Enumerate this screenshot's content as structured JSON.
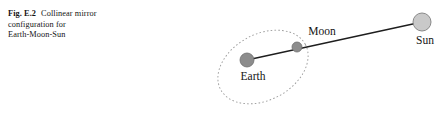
{
  "figure": {
    "caption": {
      "label": "Fig. E.2",
      "line1": "Collinear mirror",
      "line2": "configuration for",
      "line3": "Earth-Moon-Sun",
      "full_text": "Fig. E.2  Collinear mirror configuration for Earth-Moon-Sun"
    },
    "diagram": {
      "type": "schematic",
      "title": "Collinear mirror configuration for Earth-Moon-Sun",
      "bodies": [
        {
          "id": "earth",
          "label": "Earth",
          "cx": 247,
          "cy": 60,
          "r": 7,
          "fill": "#8c8c8c",
          "stroke": "#6e6e6e",
          "label_x": 253,
          "label_y": 80,
          "label_anchor": "middle"
        },
        {
          "id": "moon",
          "label": "Moon",
          "cx": 297,
          "cy": 47,
          "r": 5,
          "fill": "#8c8c8c",
          "stroke": "#6e6e6e",
          "label_x": 322,
          "label_y": 35,
          "label_anchor": "middle"
        },
        {
          "id": "sun",
          "label": "Sun",
          "cx": 422,
          "cy": 22,
          "r": 9,
          "fill": "#c9c9c9",
          "stroke": "#8a8a8a",
          "label_x": 425,
          "label_y": 44,
          "label_anchor": "middle"
        }
      ],
      "sight_line": {
        "id": "collinear-sight-line",
        "from": "earth",
        "to": "sun",
        "x1": 247,
        "y1": 60,
        "x2": 422,
        "y2": 22,
        "stroke": "#1e1e1e",
        "stroke_width": 1.3
      },
      "orbit": {
        "id": "moon-orbit",
        "shape": "ellipse",
        "cx": 263,
        "cy": 67,
        "rx": 48,
        "ry": 33,
        "rotation_deg": -28,
        "stroke": "#9a9a9a",
        "stroke_width": 0.9,
        "dash": "1.6 2.2"
      },
      "colors": {
        "background": "#ffffff",
        "line": "#1e1e1e",
        "orbit": "#9a9a9a",
        "body_dark": "#8c8c8c",
        "body_light": "#c9c9c9",
        "text": "#141414"
      }
    }
  }
}
